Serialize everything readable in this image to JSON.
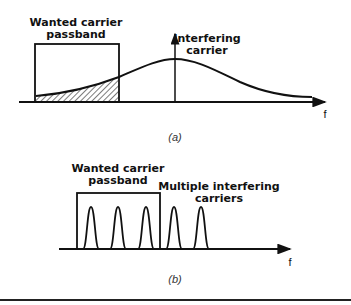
{
  "panel_a": {
    "wanted_label_line1": "Wanted carrier",
    "wanted_label_line2": "passband",
    "interfering_label_line1": "Interfering",
    "interfering_label_line2": "carrier",
    "axis_label": "f",
    "caption": "(a)"
  },
  "panel_b": {
    "wanted_label_line1": "Wanted carrier",
    "wanted_label_line2": "passband",
    "interfering_label_line1": "Multiple interfering",
    "interfering_label_line2": "carriers",
    "axis_label": "f",
    "caption": "(b)"
  },
  "colors": {
    "stroke": "#111111",
    "hatch": "#222222",
    "background": "#ffffff"
  }
}
